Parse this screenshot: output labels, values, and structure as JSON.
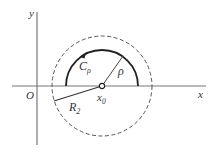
{
  "diagram": {
    "axes": {
      "x_label": "x",
      "y_label": "y",
      "origin_label": "O"
    },
    "labels": {
      "contour": "C",
      "contour_sub": "ρ",
      "small_radius": "ρ",
      "large_radius": "R",
      "large_radius_sub": "2",
      "center": "x",
      "center_sub": "0"
    },
    "geometry": {
      "center": [
        102,
        86
      ],
      "small_radius_px": 36,
      "large_radius_px": 50
    },
    "colors": {
      "axis": "#777777",
      "curve": "#222222",
      "dashed": "#555555",
      "text": "#333333"
    }
  }
}
